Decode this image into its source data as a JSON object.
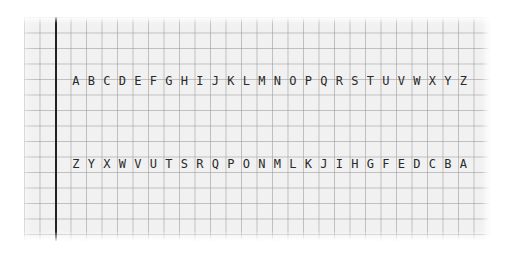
{
  "image": {
    "description": "Hand-lettered alphabet on graph paper",
    "grid_color": "#969696",
    "margin_line_color": "#222222",
    "ink_color": "#2a2a2a"
  },
  "rows": [
    {
      "text": "A B C D E F G H I J K L M N O P Q R S T U V W X Y Z"
    },
    {
      "text": "Z Y X W V U T S R Q P O N M L K J I H G F E D C B A"
    }
  ]
}
